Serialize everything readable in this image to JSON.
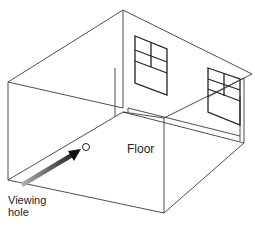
{
  "diagram": {
    "labels": {
      "floor": "Floor",
      "viewing_hole_line1": "Viewing",
      "viewing_hole_line2": "hole"
    },
    "elements": [
      "back-left wall with window",
      "back-right wall with window",
      "floor",
      "viewing hole",
      "arrow"
    ],
    "colors": {
      "line": "#3a3a3a",
      "arrow_start": "#aaaaaa",
      "arrow_end": "#111111",
      "background": "#ffffff"
    }
  }
}
